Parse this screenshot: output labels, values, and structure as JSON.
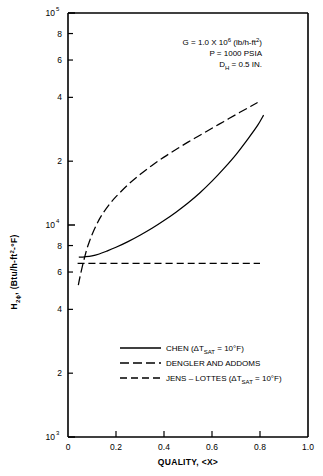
{
  "chart_data": {
    "type": "line",
    "title": "",
    "xlabel": "QUALITY, <X>",
    "ylabel": "H2ϕ, (Btu/h-ft2-°F)",
    "ylabel_parts": {
      "main": "H",
      "sub": "2ϕ",
      "rest": ", (Btu/h-ft",
      "exp": "2",
      "tail": "-°F)"
    },
    "xlim": [
      0,
      1.0
    ],
    "ylim": [
      1000,
      100000
    ],
    "yscale": "log",
    "xscale": "linear",
    "grid": false,
    "xticks": [
      "0",
      "0.2",
      "0.4",
      "0.6",
      "0.8",
      "1.0"
    ],
    "xtick_values": [
      0,
      0.2,
      0.4,
      0.6,
      0.8,
      1.0
    ],
    "ytick_labels": [
      "10",
      "8",
      "6",
      "4",
      "2",
      "10",
      "8",
      "6",
      "4",
      "2",
      "10"
    ],
    "ytick_values": [
      100000,
      80000,
      60000,
      40000,
      20000,
      10000,
      8000,
      6000,
      4000,
      2000,
      1000
    ],
    "ydecades": [
      {
        "label": "10",
        "exp": "5",
        "value": 100000
      },
      {
        "label": "10",
        "exp": "4",
        "value": 10000
      },
      {
        "label": "10",
        "exp": "3",
        "value": 1000
      }
    ],
    "legend_position": "lower-center",
    "series": [
      {
        "name": "CHEN (ΔTSAT = 10°F)",
        "style": "solid",
        "points": [
          [
            0.045,
            7050
          ],
          [
            0.07,
            7080
          ],
          [
            0.1,
            7150
          ],
          [
            0.13,
            7300
          ],
          [
            0.16,
            7520
          ],
          [
            0.2,
            7850
          ],
          [
            0.25,
            8350
          ],
          [
            0.3,
            8950
          ],
          [
            0.35,
            9650
          ],
          [
            0.4,
            10500
          ],
          [
            0.45,
            11500
          ],
          [
            0.5,
            12700
          ],
          [
            0.55,
            14200
          ],
          [
            0.6,
            16100
          ],
          [
            0.65,
            18500
          ],
          [
            0.7,
            21500
          ],
          [
            0.75,
            25500
          ],
          [
            0.79,
            29500
          ],
          [
            0.815,
            33000
          ]
        ]
      },
      {
        "name": "DENGLER AND ADDOMS",
        "style": "dashed-long",
        "points": [
          [
            0.043,
            5200
          ],
          [
            0.05,
            5700
          ],
          [
            0.06,
            6400
          ],
          [
            0.07,
            7100
          ],
          [
            0.08,
            7800
          ],
          [
            0.09,
            8400
          ],
          [
            0.1,
            9000
          ],
          [
            0.12,
            10100
          ],
          [
            0.14,
            11100
          ],
          [
            0.17,
            12400
          ],
          [
            0.2,
            13600
          ],
          [
            0.25,
            15500
          ],
          [
            0.3,
            17300
          ],
          [
            0.35,
            19100
          ],
          [
            0.4,
            20900
          ],
          [
            0.45,
            22700
          ],
          [
            0.5,
            24600
          ],
          [
            0.55,
            26500
          ],
          [
            0.6,
            28600
          ],
          [
            0.65,
            30800
          ],
          [
            0.7,
            33200
          ],
          [
            0.75,
            35700
          ],
          [
            0.79,
            37800
          ]
        ]
      },
      {
        "name": "JENS – LOTTES (ΔTSAT = 10°F)",
        "style": "dashed-medium",
        "points": [
          [
            0.04,
            6600
          ],
          [
            0.8,
            6600
          ]
        ]
      }
    ]
  },
  "annotation": {
    "line1_pre": "G = 1.0 X 10",
    "line1_exp": "6",
    "line1_post": " (lb/h-ft",
    "line1_exp2": "2",
    "line1_end": ")",
    "line2": "P = 1000 PSIA",
    "line3_pre": "D",
    "line3_sub": "H",
    "line3_post": " = 0.5 IN."
  },
  "legend": {
    "entries": [
      {
        "style": "solid",
        "pre": "CHEN (ΔT",
        "sub": "SAT",
        "post": " = 10°F)"
      },
      {
        "style": "dashed-long",
        "pre": "DENGLER AND ADDOMS",
        "sub": "",
        "post": ""
      },
      {
        "style": "dashed-medium",
        "pre": "JENS – LOTTES (ΔT",
        "sub": "SAT",
        "post": " = 10°F)"
      }
    ]
  },
  "axes": {
    "x_title_pre": "QUALITY, ",
    "x_title_post": "<X>"
  },
  "colors": {
    "ink": "#000000",
    "background": "#ffffff"
  }
}
